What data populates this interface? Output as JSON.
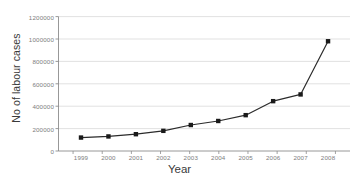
{
  "chart_data": {
    "type": "line",
    "title": "",
    "xlabel": "Year",
    "ylabel": "No of labour cases",
    "categories": [
      "1999",
      "2000",
      "2001",
      "2002",
      "2003",
      "2004",
      "2005",
      "2006",
      "2007",
      "2008"
    ],
    "values": [
      120000,
      130000,
      150000,
      180000,
      232000,
      268000,
      320000,
      445000,
      505000,
      980000
    ],
    "series": [
      {
        "name": "No of labour cases",
        "values": [
          120000,
          130000,
          150000,
          180000,
          232000,
          268000,
          320000,
          445000,
          505000,
          980000
        ]
      }
    ],
    "ylim": [
      0,
      1200000
    ],
    "yticks": [
      0,
      200000,
      400000,
      600000,
      800000,
      1000000,
      1200000
    ],
    "ytick_labels": [
      "0",
      "200000",
      "400000",
      "600000",
      "800000",
      "1000000",
      "1200000"
    ],
    "xtick_labels": [
      "1999",
      "2000",
      "2001",
      "2002",
      "2003",
      "2004",
      "2005",
      "2006",
      "2007",
      "2008"
    ],
    "grid": "horizontal",
    "legend": "none",
    "marker": "square",
    "line_color": "#2b2b2b",
    "marker_color": "#1a1a1a",
    "grid_color": "#d9d9d9",
    "axis_color": "#8c8c8c",
    "tick_label_color": "#7d7d7d",
    "background": "#ffffff"
  },
  "axes": {
    "y_title": "No of labour cases",
    "x_title": "Year"
  }
}
